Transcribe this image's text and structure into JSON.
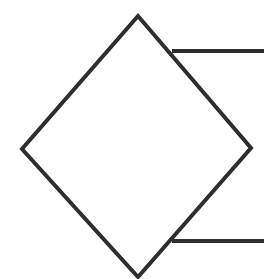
{
  "figure": {
    "title": "",
    "background_color": "#ffffff",
    "stroke_color": "#2e2e2e",
    "stroke_width": 4,
    "canvas": {
      "width": 264,
      "height": 279
    },
    "shapes": [
      {
        "name": "diamond",
        "type": "polygon",
        "label": "rotated square outline",
        "points": "138,16 251,148 138,277 22,149",
        "fill": "none"
      },
      {
        "name": "top-horizontal-line",
        "type": "line",
        "label": "upper horizontal connector",
        "x1": 172,
        "y1": 51,
        "x2": 264,
        "y2": 51
      },
      {
        "name": "bottom-horizontal-line",
        "type": "line",
        "label": "lower horizontal connector",
        "x1": 172,
        "y1": 241,
        "x2": 264,
        "y2": 241
      }
    ]
  }
}
